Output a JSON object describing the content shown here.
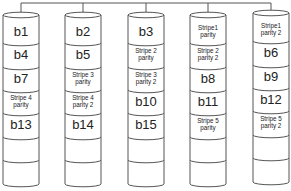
{
  "diagram": {
    "type": "RAID 6 disk array (striping with dual distributed parity)",
    "bus": {
      "color": "#555555"
    },
    "disks": [
      {
        "id": "disk-1",
        "blocks": [
          "b1",
          "b4",
          "b7",
          "Stripe 4 parity",
          "b13",
          "",
          ""
        ]
      },
      {
        "id": "disk-2",
        "blocks": [
          "b2",
          "b5",
          "Stripe 3 parity",
          "Stripe 4 parity 2",
          "b14",
          "",
          ""
        ]
      },
      {
        "id": "disk-3",
        "blocks": [
          "b3",
          "Stripe 2 parity",
          "Stripe 3 parity 2",
          "b10",
          "b15",
          "",
          ""
        ]
      },
      {
        "id": "disk-4",
        "blocks": [
          "Stripe1 parity",
          "Stripe 2 parity 2",
          "b8",
          "b11",
          "Stripe 5 parity",
          "",
          ""
        ]
      },
      {
        "id": "disk-5",
        "blocks": [
          "Stripe1 parity 2",
          "b6",
          "b9",
          "b12",
          "Stripe 5 parity 2",
          "",
          ""
        ]
      }
    ],
    "colors": {
      "outline": "#555555",
      "fill": "#ffffff",
      "text": "#222222"
    }
  }
}
